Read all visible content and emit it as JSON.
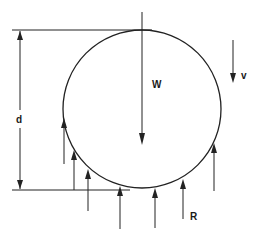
{
  "diagram": {
    "stroke_color": "#222222",
    "background": "#ffffff",
    "labels": {
      "diameter": "d",
      "weight": "W",
      "velocity": "v",
      "reaction": "R"
    },
    "elements": {
      "circle": "sphere",
      "dimension": "diameter d between horizontal reference lines",
      "weight_arrow": "downward arrow W through circle",
      "velocity_arrow": "downward arrow v at right",
      "reaction_arrows": "upward distributed reaction forces R on lower surface"
    }
  }
}
